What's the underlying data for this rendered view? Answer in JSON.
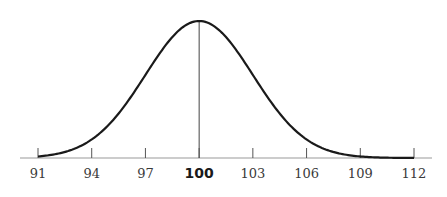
{
  "chart_data": {
    "type": "line",
    "title": "",
    "xlabel": "",
    "ylabel": "",
    "distribution": "normal",
    "mean": 100,
    "sd": 3,
    "xlim": [
      91,
      112
    ],
    "grid": false,
    "legend": null,
    "x_ticks": [
      91,
      94,
      97,
      100,
      103,
      106,
      109,
      112
    ],
    "tick_labels": [
      "91",
      "94",
      "97",
      "100",
      "103",
      "106",
      "109",
      "112"
    ],
    "highlighted_tick": "100",
    "annotations": [
      "vertical line at mean 100"
    ],
    "x": [
      91,
      92,
      93,
      94,
      95,
      96,
      97,
      98,
      99,
      100,
      101,
      102,
      103,
      104,
      105,
      106,
      107,
      108,
      109,
      110,
      111,
      112
    ],
    "values": [
      0.011,
      0.034,
      0.066,
      0.135,
      0.249,
      0.411,
      0.607,
      0.801,
      0.946,
      1.0,
      0.946,
      0.801,
      0.607,
      0.411,
      0.249,
      0.135,
      0.066,
      0.029,
      0.011,
      0.004,
      0.001,
      0.0
    ]
  },
  "colors": {
    "curve": "#1a1a1a",
    "axis": "#888888",
    "tick": "#555555",
    "mean_line": "#444444"
  }
}
